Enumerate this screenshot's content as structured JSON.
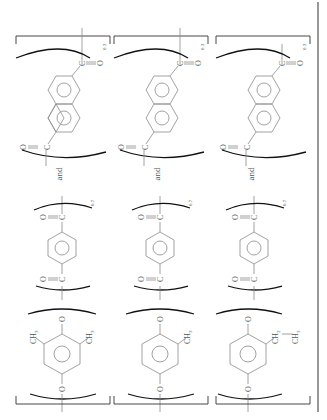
{
  "figure": {
    "orientation": "rotated-90-ccw",
    "columns": [
      {
        "id": "poly-1",
        "diol_unit": {
          "name": "2,6-dimethyl-1,4-phenylenedioxy",
          "substituents": [
            "CH3",
            "CH3"
          ],
          "atoms": [
            "O",
            "O"
          ]
        },
        "acid_unit_1": {
          "name": "terephthaloyl",
          "fraction": "0.7",
          "atoms": [
            "O",
            "C",
            "C",
            "O"
          ]
        },
        "connector": "and",
        "acid_unit_2": {
          "name": "2,6-naphthalenedicarbonyl",
          "fraction": "0.3",
          "atoms": [
            "O",
            "C",
            "C",
            "O"
          ]
        }
      },
      {
        "id": "poly-2",
        "diol_unit": {
          "name": "2-methyl-1,4-phenylenedioxy",
          "substituents": [
            "CH3"
          ],
          "atoms": [
            "O",
            "O"
          ]
        },
        "acid_unit_1": {
          "name": "terephthaloyl",
          "fraction": "0.7",
          "atoms": [
            "O",
            "C",
            "C",
            "O"
          ]
        },
        "connector": "and",
        "acid_unit_2": {
          "name": "2,6-naphthalenedicarbonyl",
          "fraction": "0.3",
          "atoms": [
            "O",
            "C",
            "C",
            "O"
          ]
        }
      },
      {
        "id": "poly-3",
        "diol_unit": {
          "name": "2-ethyl-1,4-phenylenedioxy",
          "substituents": [
            "CH2",
            "CH3"
          ],
          "atoms": [
            "O",
            "O"
          ]
        },
        "acid_unit_1": {
          "name": "terephthaloyl",
          "fraction": "0.7",
          "atoms": [
            "O",
            "C",
            "C",
            "O"
          ]
        },
        "connector": "and",
        "acid_unit_2": {
          "name": "2,6-naphthalenedicarbonyl",
          "fraction": "0.3",
          "atoms": [
            "O",
            "C",
            "C",
            "O"
          ]
        }
      }
    ],
    "labels": {
      "O": "O",
      "C": "C",
      "CH3": "CH",
      "CH2": "CH",
      "sub3": "3",
      "sub2": "2",
      "and": "and",
      "f07": "0.7",
      "f03": "0.3"
    }
  }
}
